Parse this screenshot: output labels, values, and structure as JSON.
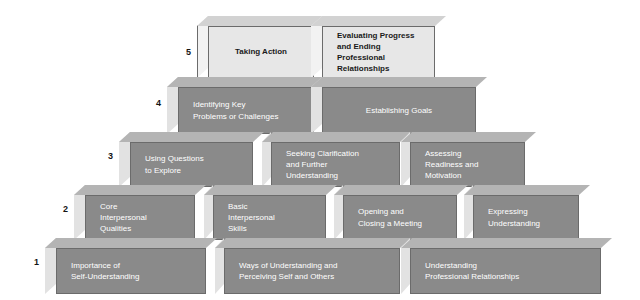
{
  "diagram": {
    "colors": {
      "brick_front_dark": "#8a8a8a",
      "brick_top_dark": "#b4b4b4",
      "brick_left_dark": "#e2e2e2",
      "brick_front_light": "#e7e7e7",
      "brick_top_light": "#d2d2d2",
      "brick_left_light": "#f2f2f2",
      "brick_outline": "#6b6b6b",
      "label_dark": "#1a1a1a",
      "label_light": "#ffffff",
      "background": "#ffffff"
    },
    "levels": [
      {
        "number": "5",
        "blocks": [
          {
            "text": "Taking Action"
          },
          {
            "text": "Evaluating Progress\nand Ending\nProfessional\nRelationships"
          }
        ]
      },
      {
        "number": "4",
        "blocks": [
          {
            "text": "Identifying Key\nProblems or Challenges"
          },
          {
            "text": "Establishing Goals"
          }
        ]
      },
      {
        "number": "3",
        "blocks": [
          {
            "text": "Using Questions\nto Explore"
          },
          {
            "text": "Seeking Clarification\nand Further\nUnderstanding"
          },
          {
            "text": "Assessing\nReadiness and\nMotivation"
          }
        ]
      },
      {
        "number": "2",
        "blocks": [
          {
            "text": "Core\nInterpersonal\nQualities"
          },
          {
            "text": "Basic\nInterpersonal\nSkills"
          },
          {
            "text": "Opening and\nClosing a Meeting"
          },
          {
            "text": "Expressing\nUnderstanding"
          }
        ]
      },
      {
        "number": "1",
        "blocks": [
          {
            "text": "Importance of\nSelf-Understanding"
          },
          {
            "text": "Ways of Understanding and\nPerceiving Self and Others"
          },
          {
            "text": "Understanding\nProfessional Relationships"
          }
        ]
      }
    ]
  }
}
